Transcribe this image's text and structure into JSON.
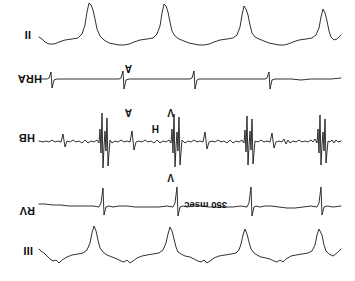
{
  "figure": {
    "type": "electrophysiology-recording",
    "orientation": "rotated-180",
    "background_color": "#ffffff",
    "trace_color": "#1a1a1a",
    "width": 355,
    "height": 281
  },
  "channels": [
    {
      "id": "iii",
      "label": "III",
      "kind": "surface-ecg",
      "label_x": 322,
      "label_y": 24,
      "top": 8,
      "height": 48,
      "baseline": 20,
      "beats": 4
    },
    {
      "id": "rv",
      "label": "RV",
      "kind": "intracardiac",
      "label_x": 320,
      "label_y": 64,
      "top": 56,
      "height": 45,
      "baseline": 18,
      "beats": 4
    },
    {
      "id": "hb",
      "label": "HB",
      "kind": "intracardiac-his-bundle",
      "label_x": 320,
      "label_y": 137,
      "top": 104,
      "height": 72,
      "baseline": 36,
      "beats": 4
    },
    {
      "id": "hra",
      "label": "HRA",
      "kind": "intracardiac-high-right-atrium",
      "label_x": 313,
      "label_y": 196,
      "top": 182,
      "height": 42,
      "baseline": 20,
      "beats": 4
    },
    {
      "id": "ii",
      "label": "II",
      "kind": "surface-ecg",
      "label_x": 324,
      "label_y": 240,
      "top": 226,
      "height": 52,
      "baseline": 16,
      "beats": 4
    }
  ],
  "caliper": {
    "text": "350 msec",
    "x": 128,
    "y": 70
  },
  "annotations": [
    {
      "id": "v-above-hb",
      "text": "V",
      "x": 181,
      "y": 98
    },
    {
      "id": "v-below-hb",
      "text": "V",
      "x": 181,
      "y": 163
    },
    {
      "id": "h-marker",
      "text": "H",
      "x": 196,
      "y": 147
    },
    {
      "id": "a-marker-hb",
      "text": "A",
      "x": 223,
      "y": 163
    },
    {
      "id": "a-marker-hra",
      "text": "A",
      "x": 223,
      "y": 207
    }
  ],
  "chart_data": {
    "type": "line",
    "xlabel": "",
    "ylabel": "",
    "grid": false,
    "legend": "none",
    "annotations": [
      "350 msec",
      "V",
      "V",
      "H",
      "A",
      "A"
    ],
    "series": [
      {
        "name": "III",
        "description": "Surface lead III, QRS complexes negative after 180 degree rotation",
        "points": "M 14 24 L 18 20 L 22 17 L 26 19 L 29 22 L 31 28 L 33 38 L 36 44 L 38 38 L 40 28 L 43 22 L 47 20 L 53 19 L 59 18 L 64 17 L 69 14 L 72 11 L 75 13 L 78 11 L 81 12 L 85 14 L 89 15 L 94 16 L 98 18 L 101 20 L 104 24 L 106 31 L 108 39 L 110 44 L 112 38 L 114 29 L 116 23 L 119 20 L 124 19 L 130 18 L 136 17 L 141 15 L 145 12 L 148 10 L 151 13 L 154 11 L 157 12 L 161 14 L 165 16 L 170 17 L 174 19 L 177 21 L 179 26 L 181 34 L 183 42 L 185 46 L 187 39 L 189 30 L 192 23 L 196 20 L 202 19 L 208 18 L 213 17 L 218 15 L 222 12 L 225 10 L 228 13 L 231 11 L 234 12 L 238 14 L 243 16 L 248 18 L 252 21 L 255 25 L 257 33 L 259 42 L 261 47 L 263 40 L 265 30 L 268 23 L 272 20 L 277 19 L 283 18 L 288 16 L 293 13 L 296 10 L 299 13 L 302 12 L 305 14 L 308 17 L 311 20 L 314 22 L 316 24"
      },
      {
        "name": "RV",
        "description": "Right ventricular electrogram, sharp biphasic ventricular spikes",
        "points": "M 14 19 L 22 18 L 28 19 L 31 18 L 33 10 L 34 38 L 36 22 L 38 18 L 44 19 L 52 18 L 60 17 L 68 17 L 76 18 L 84 19 L 90 19 L 95 18 L 99 19 L 101 18 L 103 9 L 104 38 L 106 22 L 108 18 L 114 19 L 122 18 L 130 18 L 138 18 L 146 18 L 154 19 L 162 19 L 168 18 L 172 19 L 175 18 L 177 9 L 178 38 L 180 22 L 182 18 L 188 19 L 196 18 L 204 18 L 212 18 L 220 18 L 228 19 L 236 19 L 242 18 L 246 19 L 249 18 L 251 10 L 252 37 L 254 22 L 256 18 L 262 19 L 270 19 L 278 19 L 286 19 L 294 20 L 302 20 L 310 21 L 316 21"
      },
      {
        "name": "HB",
        "description": "His bundle electrogram with large V complexes, A deflections and small H potentials on a noisy baseline",
        "points": "M 14 36 L 17 35 L 19 37 L 21 34 L 23 37 L 25 35 L 27 36 L 29 14 L 30 58 L 31 26 L 32 45 L 33 32 L 34 12 L 35 62 L 36 24 L 37 48 L 38 34 L 40 38 L 42 35 L 44 37 L 47 35 L 50 36 L 53 35 L 56 37 L 59 35 L 62 36 L 65 34 L 67 37 L 69 33 L 71 38 L 73 35 L 76 36 L 79 35 L 81 29 L 83 44 L 85 35 L 88 36 L 91 35 L 94 37 L 97 35 L 100 36 L 102 13 L 103 58 L 104 27 L 105 46 L 106 31 L 107 12 L 108 61 L 109 25 L 110 47 L 111 34 L 113 37 L 116 35 L 119 36 L 122 34 L 125 37 L 128 34 L 131 36 L 134 35 L 137 37 L 140 35 L 143 36 L 146 35 L 148 28 L 150 45 L 152 35 L 155 36 L 158 35 L 161 37 L 164 35 L 167 36 L 170 34 L 173 37 L 175 12 L 176 60 L 177 26 L 178 45 L 179 30 L 180 10 L 181 63 L 182 24 L 183 48 L 184 34 L 186 37 L 189 35 L 192 36 L 195 34 L 198 37 L 201 34 L 204 36 L 207 35 L 210 37 L 213 35 L 216 36 L 219 35 L 221 27 L 223 46 L 225 35 L 228 36 L 231 35 L 234 37 L 237 35 L 240 36 L 243 34 L 245 37 L 247 11 L 248 59 L 249 26 L 250 46 L 251 30 L 252 9 L 253 64 L 254 24 L 255 48 L 256 34 L 258 37 L 261 35 L 264 36 L 267 34 L 270 37 L 273 34 L 276 36 L 279 35 L 282 37 L 285 35 L 288 36 L 290 30 L 292 43 L 294 35 L 297 36 L 300 35 L 303 37 L 306 35 L 309 36 L 312 35 L 316 36"
      },
      {
        "name": "HRA",
        "description": "High right atrium electrogram, sharp small atrial spikes",
        "points": "M 14 21 L 24 20 L 34 20 L 44 20 L 54 19 L 64 20 L 74 20 L 80 20 L 83 19 L 85 10 L 86 27 L 88 21 L 90 20 L 96 20 L 104 20 L 112 20 L 120 20 L 128 20 L 136 20 L 144 20 L 152 20 L 156 20 L 158 19 L 160 10 L 161 28 L 163 21 L 165 20 L 172 20 L 180 20 L 188 20 L 196 20 L 204 20 L 212 20 L 220 20 L 226 20 L 229 19 L 231 10 L 232 28 L 234 21 L 236 20 L 244 20 L 252 20 L 260 20 L 268 20 L 276 20 L 284 20 L 292 20 L 298 20 L 301 19 L 303 11 L 304 27 L 306 21 L 308 20 L 312 20 L 316 20"
      },
      {
        "name": "II",
        "description": "Surface lead II, rounded deflections with sharp negative QRS after rotation",
        "points": "M 14 20 L 18 16 L 21 15 L 24 18 L 26 24 L 28 34 L 30 42 L 32 46 L 34 38 L 36 27 L 39 20 L 43 17 L 49 16 L 56 15 L 62 13 L 67 11 L 71 10 L 76 10 L 81 11 L 86 12 L 91 14 L 96 16 L 100 18 L 103 22 L 105 30 L 107 40 L 109 46 L 111 49 L 113 40 L 115 28 L 118 20 L 122 17 L 128 16 L 135 15 L 141 13 L 146 11 L 151 10 L 156 10 L 161 11 L 166 12 L 171 14 L 176 16 L 180 19 L 183 24 L 185 33 L 187 43 L 189 49 L 191 51 L 193 42 L 195 29 L 198 21 L 202 17 L 208 16 L 215 15 L 221 13 L 226 11 L 231 10 L 236 10 L 241 11 L 246 12 L 251 15 L 255 19 L 258 26 L 260 36 L 262 45 L 264 50 L 266 52 L 268 43 L 270 30 L 273 21 L 277 17 L 283 16 L 290 15 L 296 13 L 301 11 L 306 11 L 310 13 L 313 16 L 316 18"
      }
    ]
  }
}
